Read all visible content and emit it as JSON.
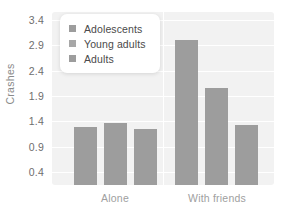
{
  "chart_data": {
    "type": "bar",
    "title": "",
    "xlabel": "",
    "ylabel": "Crashes",
    "categories": [
      "Alone",
      "With friends"
    ],
    "series": [
      {
        "name": "Adolescents",
        "values": [
          1.3,
          3.0
        ]
      },
      {
        "name": "Young adults",
        "values": [
          1.37,
          2.05
        ]
      },
      {
        "name": "Adults",
        "values": [
          1.25,
          1.33
        ]
      }
    ],
    "ylim": [
      0.15,
      3.55
    ],
    "yticks": [
      0.4,
      0.9,
      1.4,
      1.9,
      2.4,
      2.9,
      3.4
    ],
    "ytick_labels": [
      "0.4",
      "0.9",
      "1.4",
      "1.9",
      "2.4",
      "2.9",
      "3.4"
    ],
    "grid": true,
    "grid_axis": "y",
    "legend_position": "upper-left",
    "bar_color": "#9d9d9d",
    "plot_background": "#f2f2f2",
    "grid_color": "#ffffff"
  },
  "axes": {
    "y_title": "Crashes",
    "y_tick_labels": [
      "3.4",
      "2.9",
      "2.4",
      "1.9",
      "1.4",
      "0.9",
      "0.4"
    ],
    "x_tick_labels": [
      "Alone",
      "With friends"
    ]
  },
  "legend": {
    "items": [
      {
        "label": "Adolescents",
        "color": "#9d9d9d"
      },
      {
        "label": "Young adults",
        "color": "#9d9d9d"
      },
      {
        "label": "Adults",
        "color": "#9d9d9d"
      }
    ]
  }
}
